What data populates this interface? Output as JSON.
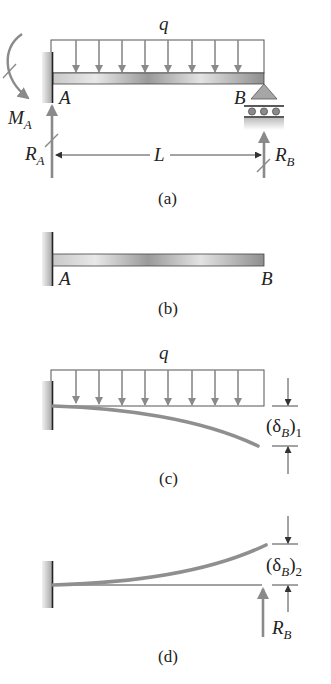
{
  "figure": {
    "panels": [
      {
        "id": "a",
        "caption": "(a)",
        "load_label": "q",
        "point_a": "A",
        "point_b": "B",
        "moment_label": "M",
        "moment_sub": "A",
        "reaction_a": "R",
        "reaction_a_sub": "A",
        "reaction_b": "R",
        "reaction_b_sub": "B",
        "length_label": "L"
      },
      {
        "id": "b",
        "caption": "(b)",
        "point_a": "A",
        "point_b": "B"
      },
      {
        "id": "c",
        "caption": "(c)",
        "load_label": "q",
        "deflection_open": "(δ",
        "deflection_sub": "B",
        "deflection_close": ")",
        "deflection_index": "1"
      },
      {
        "id": "d",
        "caption": "(d)",
        "deflection_open": "(δ",
        "deflection_sub": "B",
        "deflection_close": ")",
        "deflection_index": "2",
        "reaction_b": "R",
        "reaction_b_sub": "B"
      }
    ],
    "colors": {
      "line": "#333333",
      "arrow": "#8a8a8a",
      "beam_light": "#e6e6e6",
      "beam_dark": "#8c8c8c",
      "wall": "#b5b5b5",
      "support": "#a0a0a0",
      "deflected": "#8f8f8f"
    }
  }
}
